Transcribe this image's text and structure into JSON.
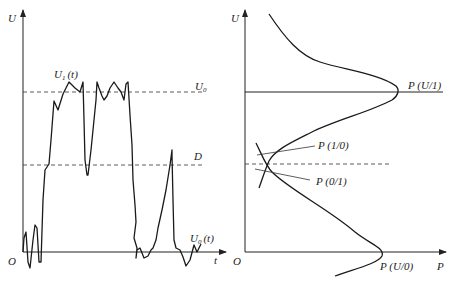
{
  "left_plot": {
    "y_axis_label": "U",
    "x_axis_label": "t",
    "origin_label": "O",
    "threshold_high_label": "U",
    "threshold_high_sub": "0",
    "decision_level_label": "D",
    "signal_high_label": "U",
    "signal_high_sub": "1",
    "signal_high_arg": "(t)",
    "signal_low_label": "U",
    "signal_low_sub": "0",
    "signal_low_arg": "(t)"
  },
  "right_plot": {
    "y_axis_label": "U",
    "x_axis_label": "P",
    "origin_label": "O",
    "pdf_one_label": "P (U/1)",
    "pdf_zero_label": "P (U/0)",
    "error_10_label": "P (1/0)",
    "error_01_label": "P (0/1)"
  },
  "colors": {
    "line": "#1a1a1a",
    "background": "#ffffff"
  }
}
